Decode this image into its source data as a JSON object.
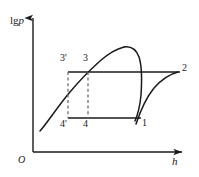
{
  "figure": {
    "title": "",
    "type": "lg p - h refrigeration cycle diagram",
    "axes": {
      "y_label_prefix": "lg",
      "y_label_var": "p",
      "x_label": "h",
      "origin_label": "O",
      "y_axis": {
        "x": 33,
        "y_top": 15,
        "y_bottom": 152
      },
      "x_axis": {
        "y": 152,
        "x_left": 33,
        "x_right": 186
      }
    },
    "points": [
      {
        "name": "1",
        "label": "1",
        "x": 140,
        "y": 118,
        "label_x": 142,
        "label_y": 118
      },
      {
        "name": "2",
        "label": "2",
        "x": 178,
        "y": 72,
        "label_x": 181,
        "label_y": 66
      },
      {
        "name": "3",
        "label": "3",
        "x": 88,
        "y": 72,
        "label_x": 84,
        "label_y": 55
      },
      {
        "name": "3p",
        "label": "3'",
        "x": 68,
        "y": 72,
        "label_x": 62,
        "label_y": 55
      },
      {
        "name": "4",
        "label": "4",
        "x": 88,
        "y": 118,
        "label_x": 84,
        "label_y": 120
      },
      {
        "name": "4p",
        "label": "4'",
        "x": 68,
        "y": 118,
        "label_x": 62,
        "label_y": 120
      }
    ],
    "colors": {
      "stroke": "#1a1a1a",
      "dashed": "#7a7a7a",
      "background": "#ffffff"
    },
    "lines": {
      "top_isobar": {
        "from_x": 68,
        "to_x": 180,
        "y": 72,
        "style": "solid"
      },
      "bottom_isobar": {
        "from_x": 68,
        "to_x": 140,
        "y": 118,
        "style": "solid"
      },
      "dashed_vertical_3p_4p": {
        "x": 68,
        "from_y": 72,
        "to_y": 118,
        "style": "dashed"
      },
      "dashed_vertical_3_4": {
        "x": 88,
        "from_y": 72,
        "to_y": 118,
        "style": "dashed"
      }
    },
    "curves": {
      "saturation_dome_left": "left branch of two-phase dome rising through point 3",
      "saturation_dome_right": "right branch descending steeply through point 1",
      "compression_1_to_2": "superheat curve from point 1 up to point 2"
    }
  }
}
